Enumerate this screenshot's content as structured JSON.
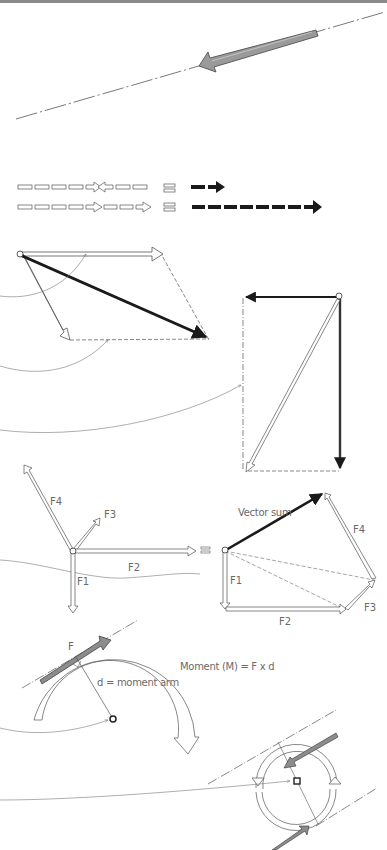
{
  "diagram": {
    "sections": [
      {
        "id": "line-of-action",
        "description": "Force arrow along dash-dot line of action"
      },
      {
        "id": "collinear-addition",
        "description": "Collinear forces summed to a resultant"
      },
      {
        "id": "parallelogram",
        "description": "Parallelogram rule for two forces"
      },
      {
        "id": "rectangle-components",
        "description": "Resolution into perpendicular components"
      },
      {
        "id": "polygon",
        "description": "Force polygon vector sum"
      },
      {
        "id": "moment",
        "description": "Moment of a force about a point"
      },
      {
        "id": "couple",
        "description": "Couple of equal opposite forces"
      }
    ],
    "symbols": {
      "equals": "≡"
    },
    "polygon": {
      "labels_left": {
        "f1": "F1",
        "f2": "F2",
        "f3": "F3",
        "f4": "F4"
      },
      "labels_right": {
        "f1": "F1",
        "f2": "F2",
        "f3": "F3",
        "f4": "F4"
      },
      "vector_sum": "Vector sum"
    },
    "moment": {
      "force_label": "F",
      "arm_label": "d = moment arm",
      "formula": "Moment (M) = F x d"
    },
    "colors": {
      "line": "#555555",
      "fill_dark": "#1a1a1a",
      "fill_gray": "#8c8c8c",
      "label": "#6a6a6a"
    }
  }
}
